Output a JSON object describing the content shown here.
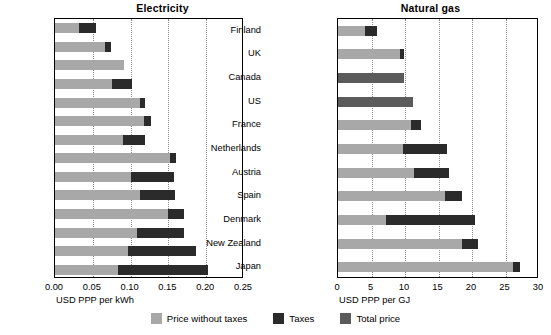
{
  "legend": {
    "items": [
      {
        "label": "Price without taxes",
        "color": "#a8a8a8",
        "key": "light"
      },
      {
        "label": "Taxes",
        "color": "#2b2b2b",
        "key": "dark"
      },
      {
        "label": "Total price",
        "color": "#5b5b5b",
        "key": "total"
      }
    ]
  },
  "chart_data": [
    {
      "type": "bar",
      "id": "electricity",
      "title": "Electricity",
      "orientation": "horizontal",
      "stacked": true,
      "xlabel": "USD PPP per kWh",
      "ylabel": "",
      "xlim": [
        0,
        0.25
      ],
      "xticks": [
        0,
        0.05,
        0.1,
        0.15,
        0.2,
        0.25
      ],
      "xtick_labels": [
        "0.00",
        "0.05",
        "0.10",
        "0.15",
        "0.20",
        "0.25"
      ],
      "grid": "vertical-dotted",
      "legend_position": "bottom-center",
      "categories": [
        "Norway",
        "Canada",
        "US*",
        "Finland",
        "UK",
        "New Zealand",
        "France",
        "Japan",
        "Austria",
        "Spain",
        "Germany",
        "Italy",
        "Netherlands",
        "Denmark"
      ],
      "series": [
        {
          "name": "Price without taxes",
          "values": [
            0.032,
            0.066,
            0.091,
            0.076,
            0.113,
            0.118,
            0.09,
            0.152,
            0.1,
            0.113,
            0.15,
            0.108,
            0.096,
            0.083
          ]
        },
        {
          "name": "Taxes",
          "values": [
            0.022,
            0.008,
            0.0,
            0.026,
            0.006,
            0.009,
            0.029,
            0.008,
            0.058,
            0.046,
            0.021,
            0.063,
            0.09,
            0.119
          ]
        }
      ],
      "totals": [
        0.054,
        0.074,
        0.091,
        0.102,
        0.119,
        0.127,
        0.119,
        0.16,
        0.158,
        0.159,
        0.171,
        0.171,
        0.186,
        0.202
      ]
    },
    {
      "type": "bar",
      "id": "natural-gas",
      "title": "Natural gas",
      "orientation": "horizontal",
      "stacked": true,
      "xlabel": "USD PPP per GJ",
      "ylabel": "",
      "xlim": [
        0,
        30
      ],
      "xticks": [
        0,
        5,
        10,
        15,
        20,
        25,
        30
      ],
      "xtick_labels": [
        "0",
        "5",
        "10",
        "15",
        "20",
        "25",
        "30"
      ],
      "grid": "vertical-dotted",
      "legend_position": "bottom-center",
      "categories": [
        "Finland",
        "UK",
        "Canada",
        "US",
        "France",
        "Netherlands",
        "Austria",
        "Spain",
        "Denmark",
        "New Zealand",
        "Japan"
      ],
      "series": [
        {
          "name": "Price without taxes",
          "values": [
            4.0,
            9.3,
            0.0,
            0.0,
            10.9,
            9.7,
            11.4,
            15.9,
            7.2,
            18.5,
            26.1
          ]
        },
        {
          "name": "Taxes",
          "values": [
            1.8,
            0.5,
            0.0,
            0.0,
            1.5,
            6.5,
            5.1,
            2.6,
            13.3,
            2.4,
            1.0
          ]
        },
        {
          "name": "Total price",
          "values": [
            0.0,
            0.0,
            9.8,
            11.2,
            0.0,
            0.0,
            0.0,
            0.0,
            0.0,
            0.0,
            0.0
          ]
        }
      ],
      "totals": [
        5.8,
        9.8,
        9.8,
        11.2,
        12.4,
        16.2,
        16.5,
        18.5,
        20.5,
        20.9,
        27.1
      ]
    }
  ]
}
